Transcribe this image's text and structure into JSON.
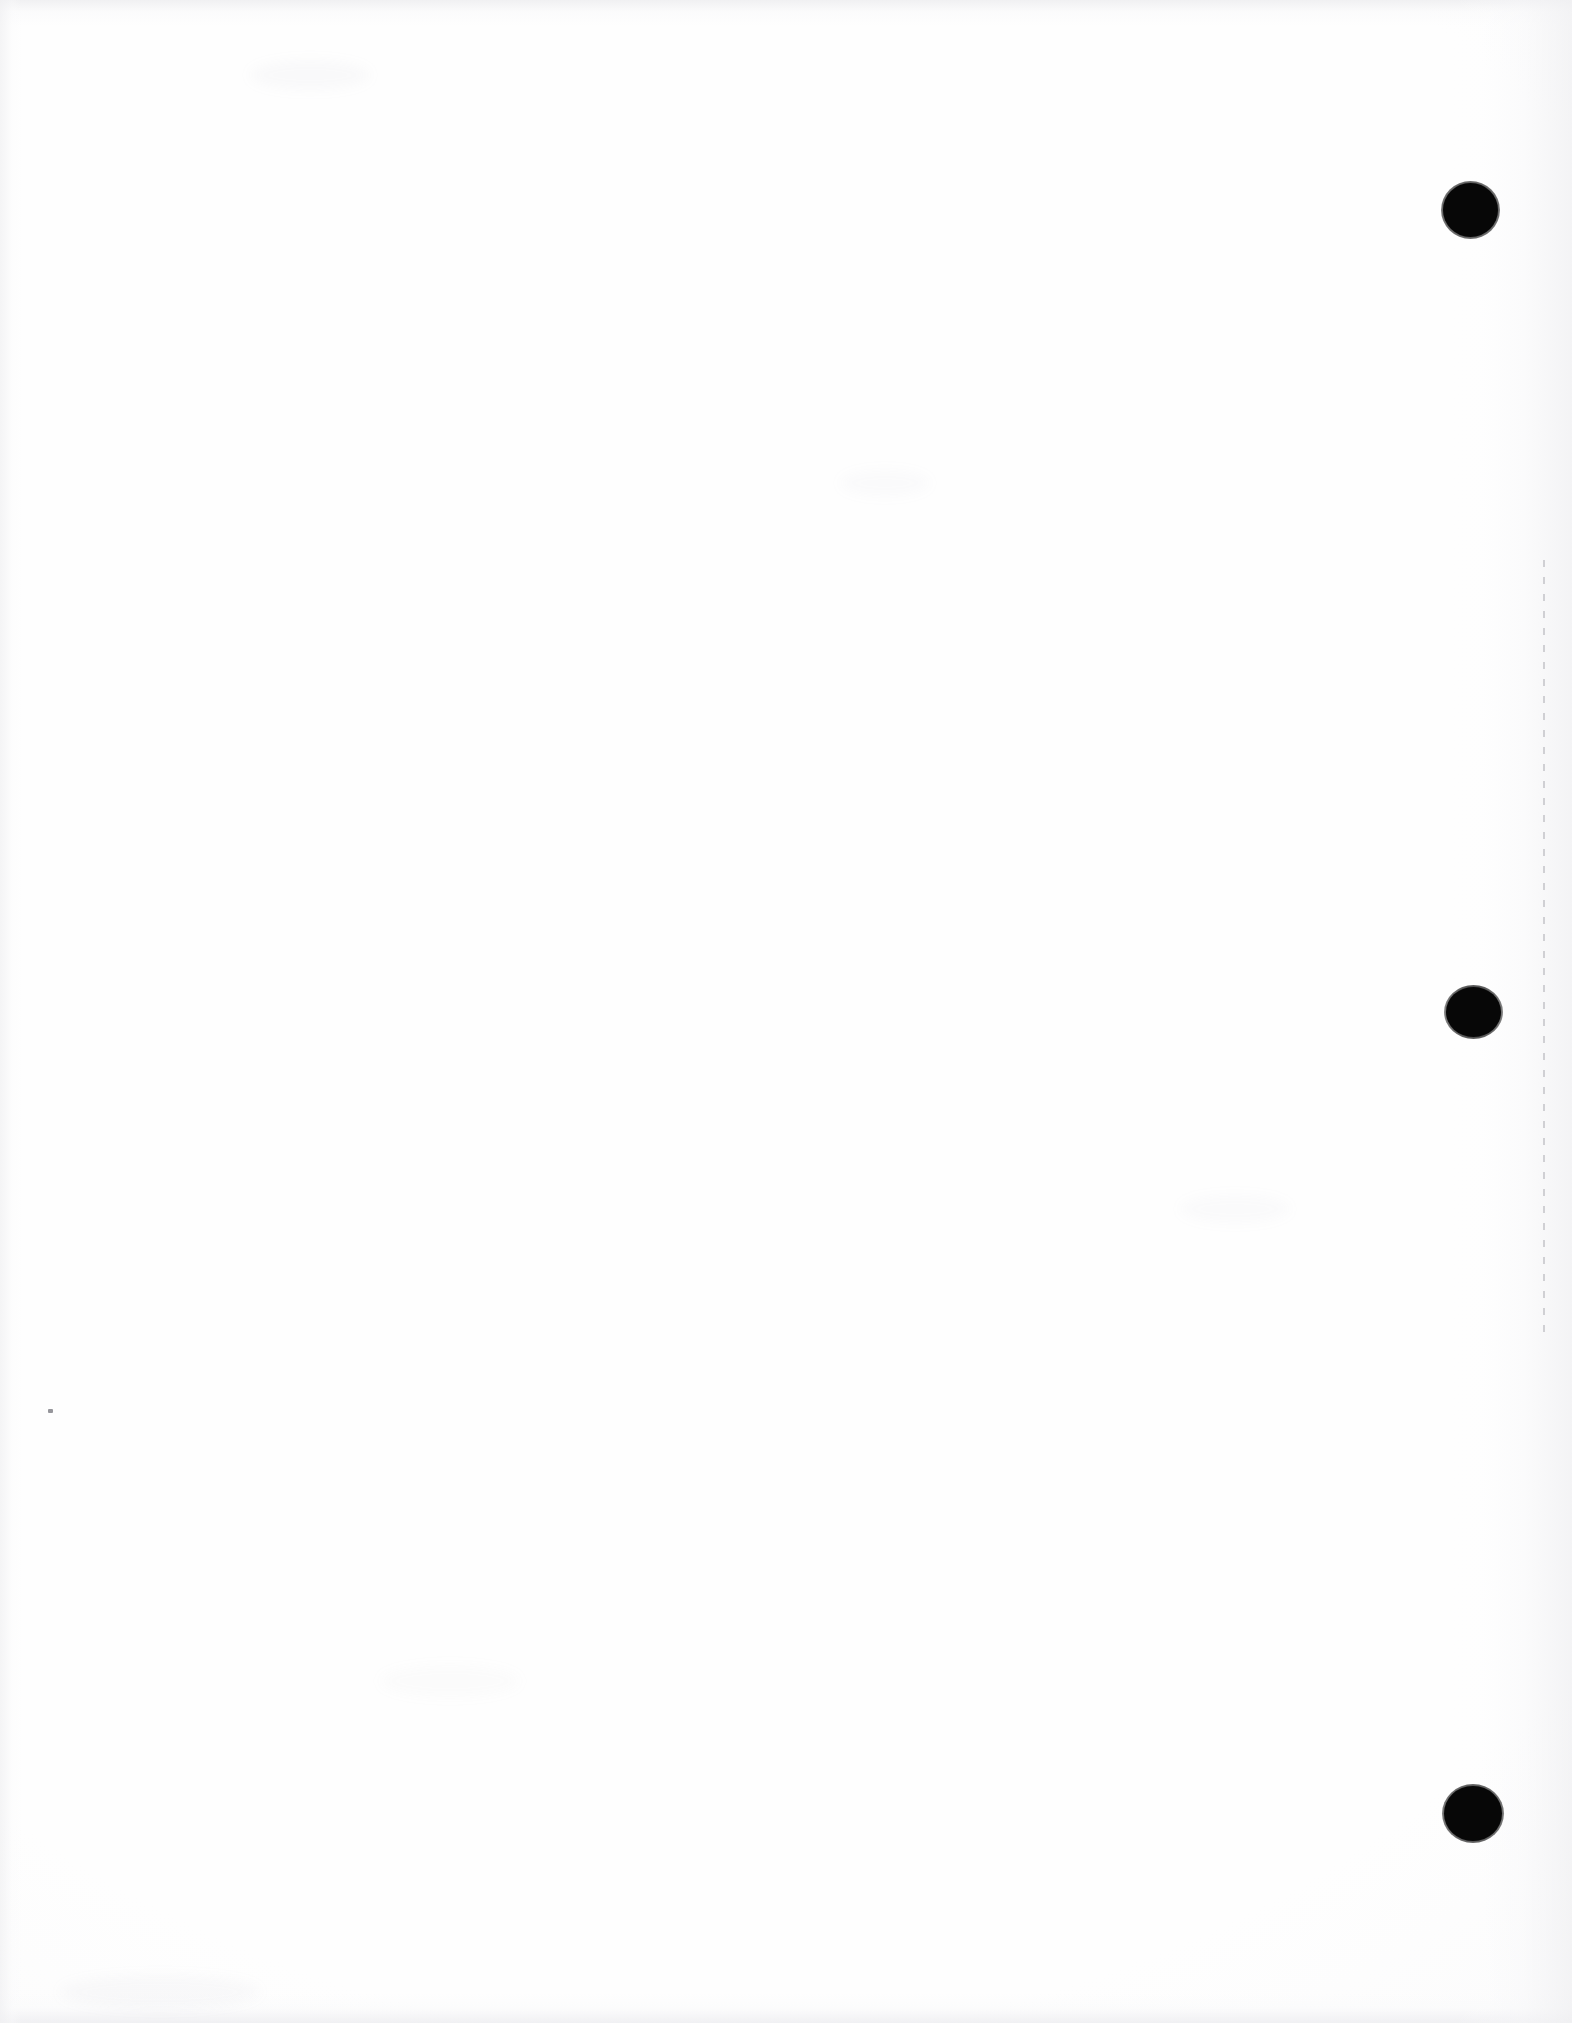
{
  "page": {
    "kind": "scanned-blank-page",
    "width": 1572,
    "height": 2023,
    "background_color": "#fefefe",
    "ink_color": "#070707",
    "body_text": "",
    "caption": ""
  },
  "marks": {
    "label": "binder punch-hole marks",
    "color": "#070707",
    "items": [
      {
        "name": "hole-mark-top",
        "x": 1443,
        "y": 183,
        "width": 55,
        "height": 54
      },
      {
        "name": "hole-mark-middle",
        "x": 1446,
        "y": 987,
        "width": 55,
        "height": 50
      },
      {
        "name": "hole-mark-bottom",
        "x": 1444,
        "y": 1786,
        "width": 58,
        "height": 55
      }
    ]
  },
  "margin_rule": {
    "name": "right-margin-dashed-rule",
    "color": "#c3c3c8",
    "x": 1543,
    "y": 560,
    "height": 780
  },
  "artifacts": {
    "dust_speck": {
      "x": 48,
      "y": 1409,
      "width": 5,
      "height": 4,
      "color": "#96969b"
    },
    "smudges": [
      {
        "x": 250,
        "y": 60,
        "width": 120,
        "height": 30,
        "opacity": 0.05
      },
      {
        "x": 840,
        "y": 470,
        "width": 90,
        "height": 26,
        "opacity": 0.04
      },
      {
        "x": 1180,
        "y": 1195,
        "width": 110,
        "height": 28,
        "opacity": 0.04
      },
      {
        "x": 380,
        "y": 1665,
        "width": 140,
        "height": 32,
        "opacity": 0.035
      },
      {
        "x": 60,
        "y": 1975,
        "width": 200,
        "height": 34,
        "opacity": 0.05
      }
    ]
  }
}
